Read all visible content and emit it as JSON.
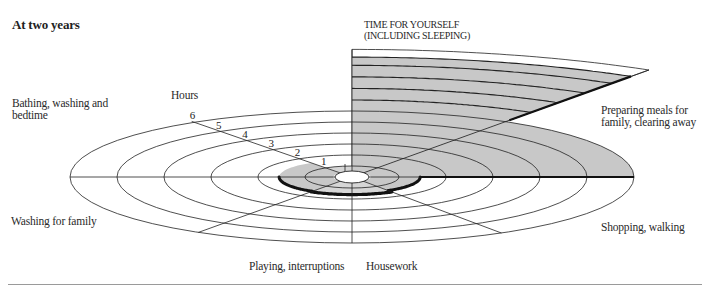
{
  "title": "At two years",
  "axis": {
    "label": "Hours",
    "ticks": [
      "1",
      "2",
      "3",
      "4",
      "5",
      "6"
    ]
  },
  "labels": {
    "time_for_yourself_line1": "TIME FOR YOURSELF",
    "time_for_yourself_line2": "(INCLUDING SLEEPING)",
    "meals_line1": "Preparing meals for",
    "meals_line2": "family, clearing away",
    "bathing_line1": "Bathing, washing and",
    "bathing_line2": "bedtime",
    "washing": "Washing for family",
    "shopping": "Shopping, walking",
    "playing": "Playing, interruptions",
    "housework": "Housework"
  },
  "colors": {
    "shade": "#c8c8c8",
    "shade_light": "#d6d6d6",
    "line": "#222222",
    "rule": "#9a9a9a"
  },
  "chart_data": {
    "type": "pie",
    "title": "At two years",
    "subtitle": "Hours per day spent on activities (radial elliptical sector chart)",
    "axis_label": "Hours",
    "rings": [
      1,
      2,
      3,
      4,
      5,
      6
    ],
    "categories": [
      "Time for yourself (including sleeping)",
      "Preparing meals for family, clearing away",
      "Shopping, walking",
      "Housework",
      "Playing, interruptions",
      "Washing for family",
      "Bathing, washing and bedtime"
    ],
    "values": [
      11.5,
      6,
      1.5,
      1.6,
      1.6,
      1.6,
      1.6
    ],
    "grid": true
  }
}
